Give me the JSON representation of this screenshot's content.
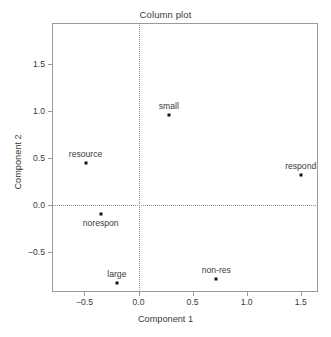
{
  "chart_data": {
    "type": "scatter",
    "title": "Column plot",
    "xlabel": "Component 1",
    "ylabel": "Component 2",
    "xlim": [
      -0.8,
      1.66
    ],
    "ylim": [
      -0.92,
      1.93
    ],
    "xticks": [
      -0.5,
      0.0,
      0.5,
      1.0,
      1.5
    ],
    "xticklabels": [
      "−0.5",
      "0.0",
      "0.5",
      "1.0",
      "1.5"
    ],
    "yticks": [
      -0.5,
      0.0,
      0.5,
      1.0,
      1.5
    ],
    "yticklabels": [
      "−0.5",
      "0.0",
      "0.5",
      "1.0",
      "1.5"
    ],
    "grid": false,
    "reference_lines": {
      "horizontal": 0.0,
      "vertical": 0.0,
      "style": "dotted",
      "color": "#8c8c8c"
    },
    "point_color": "#111111",
    "points": [
      {
        "label": "resource",
        "x": -0.49,
        "y": 0.45,
        "label_pos": "above"
      },
      {
        "label": "small",
        "x": 0.28,
        "y": 0.96,
        "label_pos": "above"
      },
      {
        "label": "respond",
        "x": 1.5,
        "y": 0.32,
        "label_pos": "above"
      },
      {
        "label": "norespon",
        "x": -0.35,
        "y": -0.09,
        "label_pos": "below"
      },
      {
        "label": "large",
        "x": -0.2,
        "y": -0.82,
        "label_pos": "above"
      },
      {
        "label": "non-res",
        "x": 0.72,
        "y": -0.78,
        "label_pos": "above"
      }
    ]
  }
}
